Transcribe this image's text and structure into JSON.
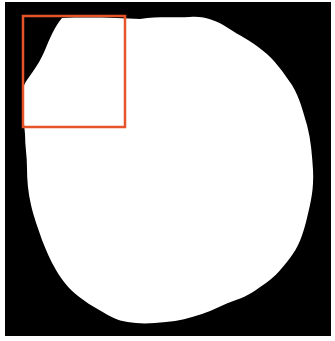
{
  "image": {
    "description": "Binary mask of a single wavy-edged white blob on a black background with an orange region-of-interest box in the upper-left",
    "background_color": "#000000",
    "blob_color": "#ffffff",
    "page_color": "#ffffff"
  },
  "annotation": {
    "type": "roi-rectangle",
    "color": "#e8542a"
  }
}
